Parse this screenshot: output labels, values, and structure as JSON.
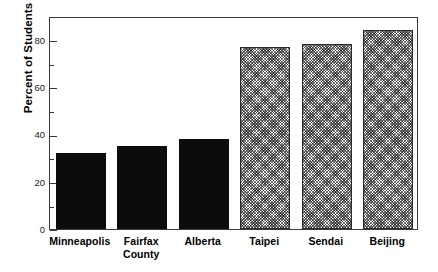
{
  "chart_data": {
    "type": "bar",
    "title": "",
    "xlabel": "",
    "ylabel": "Percent of Students",
    "categories": [
      "Minneapolis",
      "Fairfax County",
      "Alberta",
      "Taipei",
      "Sendai",
      "Beijing"
    ],
    "category_lines": [
      [
        "Minneapolis"
      ],
      [
        "Fairfax",
        "County"
      ],
      [
        "Alberta"
      ],
      [
        "Taipei"
      ],
      [
        "Sendai"
      ],
      [
        "Beijing"
      ]
    ],
    "values": [
      32,
      35,
      38,
      77,
      78,
      84
    ],
    "ylim": [
      0,
      90
    ],
    "y_major_ticks": [
      0,
      20,
      40,
      60,
      80
    ],
    "y_tick_labels": [
      "0",
      "20",
      "40",
      "60",
      "80"
    ],
    "y_minor_ticks": [
      10,
      30,
      50,
      70
    ],
    "grid": false,
    "legend": null,
    "bar_styles": [
      "solid-black",
      "solid-black",
      "solid-black",
      "hatched-gray",
      "hatched-gray",
      "hatched-gray"
    ],
    "colors": {
      "solid_fill": "#0c0c0c",
      "hatch_line": "#6e6e6e",
      "hatch_background": "#ffffff",
      "axis": "#3a3a3a",
      "text": "#000000",
      "plot_background": "#ffffff"
    }
  }
}
